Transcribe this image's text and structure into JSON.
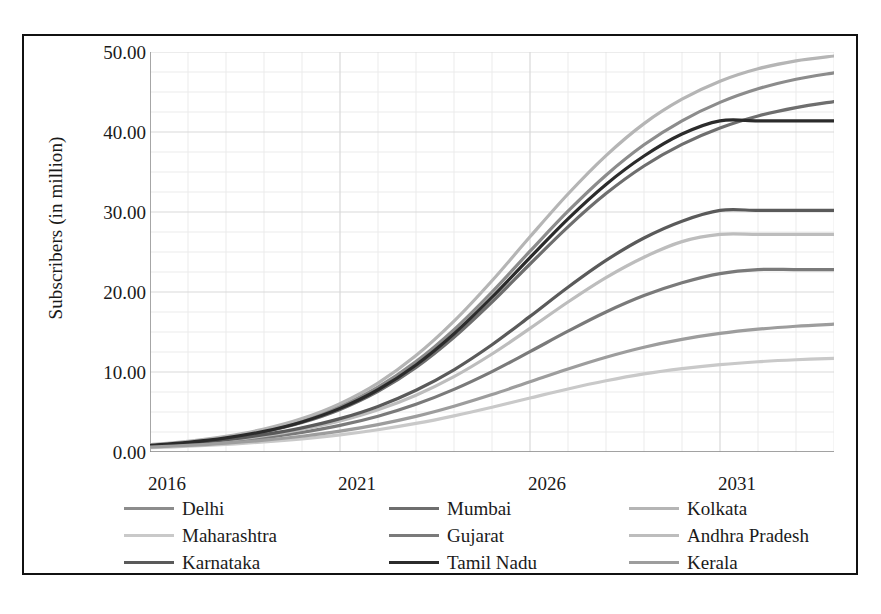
{
  "chart_data": {
    "type": "line",
    "title": "",
    "xlabel": "",
    "ylabel": "Subscribers (in million)",
    "xlim": [
      2016,
      2034
    ],
    "ylim": [
      0,
      50
    ],
    "grid": true,
    "legend_position": "bottom",
    "x_tick_labels": [
      "2016",
      "2021",
      "2026",
      "2031"
    ],
    "x_tick_values": [
      2016,
      2021,
      2026,
      2031
    ],
    "y_tick_labels": [
      "0.00",
      "10.00",
      "20.00",
      "30.00",
      "40.00",
      "50.00"
    ],
    "y_tick_values": [
      0,
      10,
      20,
      30,
      40,
      50
    ],
    "x": [
      2016,
      2017,
      2018,
      2019,
      2020,
      2021,
      2022,
      2023,
      2024,
      2025,
      2026,
      2027,
      2028,
      2029,
      2030,
      2031,
      2032,
      2033,
      2034
    ],
    "series": [
      {
        "name": "Delhi",
        "color": "#8c8c8c",
        "plateau": 48.5,
        "values": [
          0.85,
          1.25,
          1.85,
          2.7,
          3.95,
          5.7,
          8.1,
          11.3,
          15.3,
          20.0,
          25.1,
          30.1,
          34.6,
          38.4,
          41.4,
          43.7,
          45.4,
          46.6,
          47.4
        ]
      },
      {
        "name": "Mumbai",
        "color": "#6e6e6e",
        "plateau": 45.3,
        "values": [
          0.8,
          1.17,
          1.72,
          2.52,
          3.68,
          5.32,
          7.58,
          10.58,
          14.35,
          18.75,
          23.5,
          28.15,
          32.3,
          35.75,
          38.45,
          40.5,
          42.0,
          43.05,
          43.8
        ]
      },
      {
        "name": "Kolkata",
        "color": "#b5b5b5",
        "plateau": 49.8,
        "values": [
          0.9,
          1.33,
          1.96,
          2.87,
          4.18,
          6.05,
          8.62,
          12.05,
          16.35,
          21.4,
          26.9,
          32.25,
          37.05,
          41.05,
          44.1,
          46.35,
          47.9,
          48.9,
          49.5
        ]
      },
      {
        "name": "Maharashtra",
        "color": "#c9c9c9",
        "plateau": 12.2,
        "values": [
          0.55,
          0.72,
          0.95,
          1.25,
          1.64,
          2.14,
          2.78,
          3.57,
          4.52,
          5.6,
          6.75,
          7.88,
          8.9,
          9.76,
          10.42,
          10.92,
          11.28,
          11.53,
          11.7
        ]
      },
      {
        "name": "Gujarat",
        "color": "#7a7a7a",
        "plateau": 22.8,
        "values": [
          0.7,
          0.96,
          1.32,
          1.8,
          2.45,
          3.32,
          4.47,
          5.96,
          7.83,
          10.05,
          12.55,
          15.1,
          17.5,
          19.55,
          21.15,
          22.3,
          23.05,
          23.55,
          23.85
        ]
      },
      {
        "name": "Andhra Pradesh",
        "color": "#bdbdbd",
        "plateau": 27.2,
        "values": [
          0.75,
          1.05,
          1.47,
          2.04,
          2.82,
          3.87,
          5.27,
          7.1,
          9.42,
          12.25,
          15.45,
          18.75,
          21.8,
          24.35,
          26.3,
          27.65,
          28.55,
          29.15,
          29.5
        ]
      },
      {
        "name": "Karnataka",
        "color": "#5a5a5a",
        "plateau": 30.2,
        "values": [
          0.78,
          1.1,
          1.55,
          2.17,
          3.02,
          4.17,
          5.7,
          7.72,
          10.28,
          13.4,
          16.95,
          20.6,
          23.95,
          26.75,
          28.85,
          30.3,
          31.25,
          31.85,
          32.2
        ]
      },
      {
        "name": "Tamil Nadu",
        "color": "#2b2b2b",
        "plateau": 41.4,
        "values": [
          0.82,
          1.2,
          1.76,
          2.58,
          3.76,
          5.45,
          7.78,
          10.88,
          14.78,
          19.35,
          24.3,
          29.15,
          33.45,
          37.0,
          39.75,
          41.8,
          43.25,
          44.25,
          44.9
        ]
      },
      {
        "name": "Kerala",
        "color": "#9d9d9d",
        "plateau": 16.1,
        "values": [
          0.62,
          0.83,
          1.11,
          1.48,
          1.97,
          2.6,
          3.42,
          4.45,
          5.72,
          7.18,
          8.78,
          10.38,
          11.85,
          13.1,
          14.08,
          14.82,
          15.35,
          15.72,
          15.98
        ]
      }
    ]
  },
  "legend": {
    "entries": [
      {
        "label": "Delhi",
        "color": "#8c8c8c"
      },
      {
        "label": "Mumbai",
        "color": "#6e6e6e"
      },
      {
        "label": "Kolkata",
        "color": "#b5b5b5"
      },
      {
        "label": "Maharashtra",
        "color": "#c9c9c9"
      },
      {
        "label": "Gujarat",
        "color": "#7a7a7a"
      },
      {
        "label": "Andhra Pradesh",
        "color": "#bdbdbd"
      },
      {
        "label": "Karnataka",
        "color": "#5a5a5a"
      },
      {
        "label": "Tamil Nadu",
        "color": "#2b2b2b"
      },
      {
        "label": "Kerala",
        "color": "#9d9d9d"
      }
    ]
  },
  "style": {
    "grid_major_color": "#d9d9d9",
    "grid_minor_color": "#ebebeb",
    "frame_color": "#111111",
    "background": "#ffffff"
  }
}
